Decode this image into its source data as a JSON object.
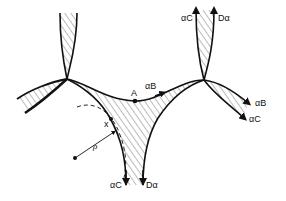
{
  "diagram": {
    "type": "grain-boundary-channel-network",
    "colors": {
      "line": "#111111",
      "hatch": "#444444",
      "background": "#ffffff"
    },
    "labels": {
      "top_left_arrow": "αC",
      "top_right_arrow": "Dα",
      "point_A": "A",
      "middle_flow": "αB",
      "right_upper": "αB",
      "right_lower": "αC",
      "bottom_left_arrow": "αC",
      "bottom_right_arrow": "Dα",
      "point_x": "x",
      "radius": "ρ"
    },
    "elements": [
      "two triple junctions connected by a hatched channel",
      "vertical hatched channel above each junction",
      "hatched branch extending lower-left from left junction",
      "hatched branch extending lower-right from right junction",
      "hatched channel descending from between junctions",
      "dashed circle of radius ρ tangent at point x",
      "point A on upper boundary with flow arrow αB"
    ]
  }
}
